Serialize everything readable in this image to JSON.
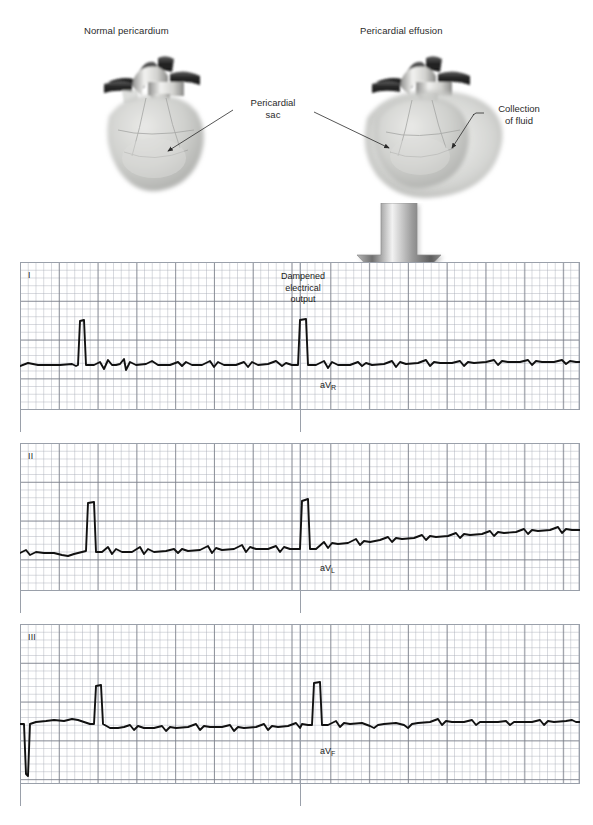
{
  "figure": {
    "anatomy": {
      "panels": [
        {
          "id": "normal",
          "caption": "Normal pericardium"
        },
        {
          "id": "effusion",
          "caption": "Pericardial effusion"
        }
      ],
      "callouts": [
        {
          "id": "pericardial-sac",
          "line1": "Pericardial",
          "line2": "sac"
        },
        {
          "id": "collection-fluid",
          "line1": "Collection",
          "line2": "of fluid"
        }
      ],
      "arrow": {
        "name": "down-arrow",
        "direction": "down",
        "color": "#9a9a9a"
      }
    },
    "annotation": {
      "dampened": {
        "line1": "Dampened",
        "line2": "electrical",
        "line3": "output"
      }
    },
    "ecg": {
      "paper": {
        "background": "#ffffff",
        "fine_grid_color": "#a8acb6",
        "bold_grid_color": "#787c86",
        "trace_color": "#111111",
        "small_box_px": 7.76,
        "large_box_px": 38.8
      },
      "strips": [
        {
          "id": "strip-1",
          "left_lead": "I",
          "right_lead_base": "aV",
          "right_lead_sub": "R"
        },
        {
          "id": "strip-2",
          "left_lead": "II",
          "right_lead_base": "aV",
          "right_lead_sub": "L"
        },
        {
          "id": "strip-3",
          "left_lead": "III",
          "right_lead_base": "aV",
          "right_lead_sub": "F"
        }
      ]
    }
  },
  "chart_data": {
    "type": "line",
    "xlabel": "",
    "ylabel": "",
    "grid": true,
    "legend": false,
    "annotations": [
      "Dampened electrical output"
    ],
    "series": [
      {
        "name": "I",
        "note": "calibration pulse then low-voltage complexes",
        "path": "M 0 104 L 8 101 L 18 103 L 40 103 L 52 102 L 56 104 L 58 103 L 60 59 L 64 58 L 66 103 L 74 103 L 80 100 L 84 107 L 88 98 L 92 103 L 96 103 L 100 102 L 104 97 L 106 108 L 110 100 L 116 103 L 126 102 L 132 99 L 138 103 L 150 103 L 158 100 L 162 104 L 166 100 L 172 103 L 182 103 L 190 99 L 194 105 L 198 100 L 204 103 L 216 103 L 224 100 L 228 105 L 232 100 L 238 103 L 248 102 L 256 99 L 262 104 L 266 101 L 272 103 L 278 103 L 280 58 L 286 57 L 288 103 L 296 103 L 304 99 L 308 106 L 312 100 L 318 103 L 330 103 L 338 100 L 342 104 L 346 101 L 352 103 L 364 102 L 372 99 L 376 105 L 380 100 L 386 102 L 398 101 L 406 98 L 410 104 L 414 100 L 420 101 L 432 101 L 440 99 L 444 104 L 448 100 L 454 101 L 466 100 L 474 98 L 478 103 L 482 99 L 488 100 L 500 100 L 508 98 L 512 103 L 516 99 L 522 100 L 534 100 L 542 98 L 546 102 L 550 99 L 556 100 L 560 100"
      },
      {
        "name": "II",
        "note": "slow upward baseline drift, low-voltage complexes",
        "path": "M 0 110 L 6 107 L 10 112 L 16 109 L 24 110 L 34 110 L 42 112 L 48 113 L 54 111 L 62 109 L 66 108 L 68 60 L 74 59 L 76 109 L 82 109 L 88 104 L 92 111 L 96 106 L 102 109 L 112 109 L 120 104 L 124 111 L 128 106 L 134 109 L 146 108 L 154 106 L 158 110 L 162 106 L 168 108 L 180 107 L 188 103 L 192 110 L 196 105 L 202 107 L 214 106 L 222 102 L 226 109 L 230 104 L 236 106 L 248 106 L 256 103 L 260 109 L 264 104 L 270 106 L 280 106 L 282 58 L 288 56 L 290 106 L 296 106 L 304 99 L 308 105 L 312 100 L 318 101 L 328 100 L 336 96 L 340 102 L 344 98 L 350 99 L 360 97 L 368 94 L 372 99 L 376 95 L 382 96 L 394 95 L 402 92 L 406 97 L 410 93 L 416 94 L 428 93 L 436 90 L 440 95 L 444 91 L 450 92 L 462 91 L 470 88 L 474 93 L 478 89 L 484 90 L 496 89 L 504 86 L 508 91 L 512 87 L 518 88 L 530 87 L 538 84 L 542 90 L 546 86 L 552 87 L 560 87"
      },
      {
        "name": "III",
        "note": "deep initial artefact deflection then low-voltage complexes",
        "path": "M 0 100 L 4 100 L 6 150 L 8 152 L 10 100 L 16 98 L 26 97 L 34 96 L 44 97 L 52 95 L 58 96 L 64 98 L 70 100 L 74 100 L 76 62 L 81 61 L 83 100 L 90 104 L 98 104 L 104 103 L 110 101 L 114 106 L 118 102 L 124 104 L 134 104 L 142 102 L 146 107 L 150 103 L 156 104 L 168 103 L 176 100 L 180 106 L 184 102 L 190 103 L 202 103 L 210 101 L 214 107 L 218 103 L 224 104 L 236 103 L 244 100 L 248 106 L 252 102 L 258 103 L 268 102 L 276 99 L 280 104 L 282 100 L 288 101 L 292 101 L 294 59 L 300 58 L 302 101 L 308 101 L 316 97 L 320 103 L 324 99 L 330 100 L 342 99 L 350 102 L 354 104 L 358 101 L 364 100 L 376 99 L 384 101 L 388 104 L 392 100 L 398 99 L 410 98 L 418 95 L 422 101 L 426 97 L 432 98 L 444 98 L 452 96 L 456 101 L 460 98 L 466 98 L 478 98 L 486 97 L 490 101 L 494 98 L 500 98 L 512 98 L 520 96 L 524 101 L 528 97 L 534 98 L 546 97 L 552 96 L 556 98 L 560 98"
      }
    ]
  }
}
